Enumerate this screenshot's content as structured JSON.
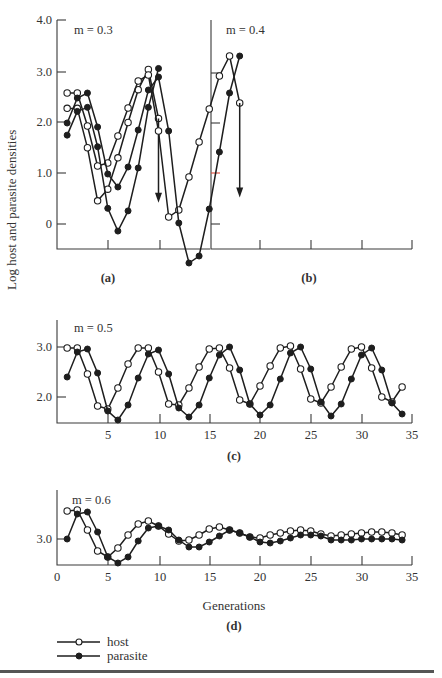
{
  "figure": {
    "ylabel": "Log host and parasite densities",
    "xlabel": "Generations",
    "legend": [
      {
        "label": "host",
        "marker": "open-circle"
      },
      {
        "label": "parasite",
        "marker": "filled-circle"
      }
    ],
    "colors": {
      "line": "#1e1e1e",
      "axis": "#3a3a3a",
      "tick_red": "#e04a3a"
    }
  },
  "chart_data": [
    {
      "type": "line",
      "panel": "(a)",
      "annotation": "m = 0.3",
      "ylabel": "Log host and parasite densities",
      "yticks": [
        "4.0",
        "3.0",
        "2.0",
        "1.0",
        "0"
      ],
      "ylim": [
        -0.5,
        4.0
      ],
      "x": [
        1,
        2,
        3,
        4,
        5,
        6,
        7,
        8,
        9,
        10
      ],
      "series": [
        {
          "name": "host",
          "values": [
            2.28,
            2.28,
            1.5,
            0.45,
            0.68,
            1.3,
            2.0,
            2.65,
            3.05,
            2.08
          ],
          "end_arrow": false
        },
        {
          "name": "parasite",
          "values": [
            1.75,
            2.22,
            2.3,
            1.52,
            0.3,
            -0.15,
            0.25,
            1.1,
            2.3,
            3.07
          ],
          "end_arrow": false
        }
      ],
      "host_arrow_to": 0.45
    },
    {
      "type": "line",
      "panel": "(b)",
      "annotation": "m = 0.4",
      "ylim": [
        -0.5,
        4.0
      ],
      "x": [
        1,
        2,
        3,
        4,
        5,
        6,
        7,
        8,
        9,
        10,
        11,
        12,
        13,
        14,
        15,
        16,
        17,
        18
      ],
      "series": [
        {
          "name": "host",
          "values": [
            2.6,
            2.6,
            1.94,
            1.14,
            1.2,
            1.74,
            2.3,
            2.84,
            2.96,
            1.84,
            0.12,
            0.26,
            0.92,
            1.62,
            2.28,
            2.94,
            3.34,
            2.4
          ]
        },
        {
          "name": "parasite",
          "values": [
            2.0,
            2.5,
            2.6,
            1.92,
            0.98,
            0.72,
            1.12,
            1.86,
            2.66,
            2.92,
            1.84,
            0.0,
            -0.8,
            -0.66,
            0.28,
            1.42,
            2.6,
            3.34
          ]
        }
      ],
      "host_arrow_to": 0.55
    },
    {
      "type": "line",
      "panel": "(c)",
      "annotation": "m = 0.5",
      "yticks": [
        "3.0",
        "2.0"
      ],
      "xticks": [
        "5",
        "10",
        "15",
        "20",
        "25",
        "30",
        "35"
      ],
      "ylim": [
        1.5,
        3.5
      ],
      "x": [
        1,
        2,
        3,
        4,
        5,
        6,
        7,
        8,
        9,
        10,
        11,
        12,
        13,
        14,
        15,
        16,
        17,
        18,
        19,
        20,
        21,
        22,
        23,
        24,
        25,
        26,
        27,
        28,
        29,
        30,
        31,
        32,
        33,
        34
      ],
      "series": [
        {
          "name": "host",
          "values": [
            2.98,
            2.98,
            2.46,
            1.82,
            1.76,
            2.18,
            2.66,
            2.98,
            2.98,
            2.5,
            1.86,
            1.84,
            2.18,
            2.6,
            2.96,
            2.98,
            2.58,
            1.94,
            1.86,
            2.22,
            2.62,
            2.98,
            3.02,
            2.56,
            1.96,
            1.88,
            2.2,
            2.6,
            2.96,
            3.0,
            2.58,
            2.0,
            1.9,
            2.2
          ]
        },
        {
          "name": "parasite",
          "values": [
            2.4,
            2.9,
            2.96,
            2.48,
            1.72,
            1.54,
            1.84,
            2.38,
            2.86,
            2.94,
            2.46,
            1.78,
            1.6,
            1.84,
            2.38,
            2.84,
            3.0,
            2.54,
            1.86,
            1.64,
            1.84,
            2.36,
            2.88,
            3.0,
            2.56,
            1.9,
            1.62,
            1.86,
            2.36,
            2.84,
            2.98,
            2.54,
            1.88,
            1.66
          ]
        }
      ]
    },
    {
      "type": "line",
      "panel": "(d)",
      "annotation": "m = 0.6",
      "yticks": [
        "3.0"
      ],
      "xticks": [
        "0",
        "5",
        "10",
        "15",
        "20",
        "25",
        "30",
        "35"
      ],
      "xlabel": "Generations",
      "ylim": [
        2.5,
        3.9
      ],
      "x": [
        1,
        2,
        3,
        4,
        5,
        6,
        7,
        8,
        9,
        10,
        11,
        12,
        13,
        14,
        15,
        16,
        17,
        18,
        19,
        20,
        21,
        22,
        23,
        24,
        25,
        26,
        27,
        28,
        29,
        30,
        31,
        32,
        33,
        34
      ],
      "series": [
        {
          "name": "host",
          "values": [
            3.56,
            3.58,
            3.18,
            2.76,
            2.64,
            2.82,
            3.08,
            3.3,
            3.36,
            3.26,
            3.1,
            2.96,
            2.98,
            3.08,
            3.2,
            3.24,
            3.18,
            3.12,
            3.04,
            3.02,
            3.08,
            3.12,
            3.16,
            3.18,
            3.16,
            3.1,
            3.06,
            3.08,
            3.1,
            3.12,
            3.14,
            3.14,
            3.12,
            3.08
          ]
        },
        {
          "name": "parasite",
          "values": [
            3.0,
            3.5,
            3.54,
            3.14,
            2.64,
            2.52,
            2.64,
            2.96,
            3.22,
            3.26,
            3.18,
            2.98,
            2.84,
            2.84,
            2.94,
            3.06,
            3.18,
            3.12,
            3.04,
            2.94,
            2.92,
            2.96,
            3.02,
            3.08,
            3.08,
            3.06,
            2.98,
            2.98,
            2.98,
            3.0,
            3.0,
            3.0,
            3.0,
            2.98
          ]
        }
      ]
    }
  ],
  "panels_layout": [
    {
      "x0": 57,
      "x1": 210,
      "axisY": 249,
      "top": 20,
      "y_ref_val": 3.0,
      "y_ref_px": 72,
      "ppu": 50.5,
      "xticks_px": [
        108,
        160
      ],
      "tick_labels": [
        {
          "v": "4.0",
          "y": 20
        },
        {
          "v": "3.0",
          "y": 72
        },
        {
          "v": "2.0",
          "y": 122
        },
        {
          "v": "1.0",
          "y": 173
        },
        {
          "v": "0",
          "y": 224
        }
      ],
      "xtick_labels": [],
      "label_y": 282,
      "ann_x": 74,
      "ann_y": 30
    },
    {
      "x0": 211,
      "x1": 412,
      "axisY": 249,
      "top": 20,
      "y_ref_val": 3.0,
      "y_ref_px": 73,
      "ppu": 50.0,
      "xticks_px": [
        260,
        311,
        362,
        412
      ],
      "tick_labels": [
        {
          "v": "",
          "y": 73
        },
        {
          "v": "",
          "y": 123
        },
        {
          "v": "",
          "y": 173
        },
        {
          "v": "",
          "y": 224
        }
      ],
      "xtick_labels": [],
      "label_y": 282,
      "ann_x": 226,
      "ann_y": 30
    },
    {
      "x0": 57,
      "x1": 412,
      "axisY": 423,
      "top": 320,
      "y_ref_val": 3.0,
      "y_ref_px": 347,
      "ppu": 50.0,
      "xticks_px": [
        108,
        160,
        210,
        260,
        311,
        362,
        412
      ],
      "tick_labels": [
        {
          "v": "3.0",
          "y": 347
        },
        {
          "v": "2.0",
          "y": 397
        }
      ],
      "label_y": 460,
      "ann_x": 74,
      "ann_y": 328
    },
    {
      "x0": 57,
      "x1": 412,
      "axisY": 565,
      "top": 490,
      "y_ref_val": 3.0,
      "y_ref_px": 539,
      "ppu": 50.0,
      "xticks_px": [
        108,
        160,
        210,
        260,
        311,
        362,
        412
      ],
      "tick_labels": [
        {
          "v": "3.0",
          "y": 539
        }
      ],
      "label_y": 630,
      "ann_x": 72,
      "ann_y": 500
    }
  ]
}
